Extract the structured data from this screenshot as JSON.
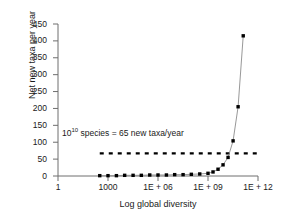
{
  "chart_data": {
    "type": "line",
    "title": "",
    "subtitle": "",
    "xlabel": "Log global diversity",
    "ylabel": "Net new taxa per year",
    "xscale": "log",
    "xlim": [
      1,
      1000000000000
    ],
    "ylim": [
      0,
      450
    ],
    "grid": false,
    "legend": null,
    "xticks": [
      {
        "value": 1,
        "label": "1"
      },
      {
        "value": 1000,
        "label": "1000"
      },
      {
        "value": 1000000,
        "label": "1E + 06"
      },
      {
        "value": 1000000000,
        "label": "1E + 09"
      },
      {
        "value": 1000000000000,
        "label": "1E + 12"
      }
    ],
    "yticks": [
      {
        "value": 0,
        "label": "0"
      },
      {
        "value": 50,
        "label": "50"
      },
      {
        "value": 100,
        "label": "100"
      },
      {
        "value": 150,
        "label": "150"
      },
      {
        "value": 200,
        "label": "200"
      },
      {
        "value": 250,
        "label": "250"
      },
      {
        "value": 300,
        "label": "300"
      },
      {
        "value": 350,
        "label": "350"
      },
      {
        "value": 400,
        "label": "400"
      },
      {
        "value": 450,
        "label": "450"
      }
    ],
    "series": [
      {
        "name": "net new taxa",
        "marker": "square",
        "marker_color": "#000000",
        "line_color": "#8c8c8c",
        "x": [
          320,
          1000,
          3200,
          10000,
          32000,
          100000,
          320000,
          1000000,
          3200000,
          10000000,
          32000000,
          100000000,
          320000000,
          1000000000,
          2000000000,
          4000000000,
          8000000000,
          16000000000,
          32000000000,
          64000000000,
          130000000000
        ],
        "y": [
          1,
          1,
          1,
          2,
          2,
          2,
          3,
          3,
          3,
          4,
          4,
          5,
          6,
          8,
          12,
          20,
          33,
          55,
          104,
          205,
          415
        ]
      }
    ],
    "reference_lines": [
      {
        "name": "65-new-taxa-per-year",
        "orientation": "horizontal",
        "value": 67,
        "style": "dashed",
        "color": "#000000",
        "x_start": 320,
        "x_end": 1000000000000
      }
    ],
    "annotations": [
      {
        "name": "species-rate-annotation",
        "base": "10",
        "exponent": "10",
        "text_after": " species = 65 new taxa/year",
        "full_text": "10^10 species = 65 new taxa/year"
      }
    ]
  },
  "colors": {
    "axis": "#6e6e6e",
    "marker": "#000000",
    "line": "#8c8c8c",
    "text": "#1a1a1a",
    "background": "#ffffff"
  }
}
